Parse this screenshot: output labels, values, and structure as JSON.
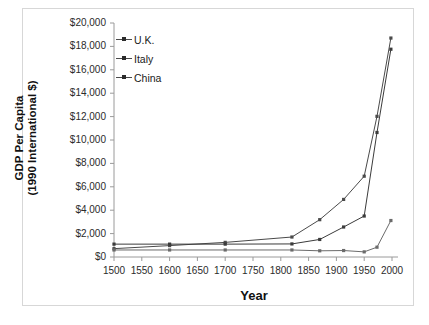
{
  "chart_data": {
    "type": "line",
    "title": "",
    "xlabel": "Year",
    "ylabel": "GDP Per Capita\n(1990 International $)",
    "ylabel_line1": "GDP Per Capita",
    "ylabel_line2": "(1990 International $)",
    "x": [
      1500,
      1600,
      1700,
      1820,
      1870,
      1913,
      1950,
      1973,
      1998
    ],
    "xlim": [
      1500,
      2000
    ],
    "ylim": [
      0,
      20000
    ],
    "xticks": [
      1500,
      1550,
      1600,
      1650,
      1700,
      1750,
      1800,
      1850,
      1900,
      1950,
      2000
    ],
    "xticklabels": [
      "1500",
      "1550",
      "1600",
      "1650",
      "1700",
      "1750",
      "1800",
      "1850",
      "1900",
      "1950",
      "2000"
    ],
    "yticks": [
      0,
      2000,
      4000,
      6000,
      8000,
      10000,
      12000,
      14000,
      16000,
      18000,
      20000
    ],
    "yticklabels": [
      "$0",
      "$2,000",
      "$4,000",
      "$6,000",
      "$8,000",
      "$10,000",
      "$12,000",
      "$14,000",
      "$16,000",
      "$18,000",
      "$20,000"
    ],
    "grid": false,
    "legend_position": "upper left",
    "series": [
      {
        "name": "U.K.",
        "color": "#4a4a4a",
        "values": [
          714,
          974,
          1250,
          1707,
          3190,
          4921,
          6907,
          12022,
          18714
        ]
      },
      {
        "name": "Italy",
        "color": "#3b3b3b",
        "values": [
          1100,
          1100,
          1100,
          1117,
          1499,
          2564,
          3502,
          10643,
          17759
        ]
      },
      {
        "name": "China",
        "color": "#6b6b6b",
        "values": [
          600,
          600,
          600,
          600,
          530,
          552,
          439,
          839,
          3117
        ]
      }
    ]
  },
  "legend": {
    "items": [
      {
        "label": "U.K."
      },
      {
        "label": "Italy"
      },
      {
        "label": "China"
      }
    ]
  },
  "axes": {
    "x_title": "Year",
    "y_title_line1": "GDP Per Capita",
    "y_title_line2": "(1990 International $)"
  }
}
